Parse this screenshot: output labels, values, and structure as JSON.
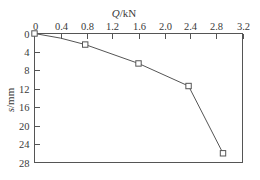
{
  "chart_data": {
    "type": "line",
    "title": "",
    "xlabel": "Q/kN",
    "ylabel": "s/mm",
    "xlabel_var": "Q",
    "xlabel_unit": "/kN",
    "ylabel_var": "s",
    "ylabel_unit": "/mm",
    "x_axis_position": "top",
    "y_axis_direction": "inverted",
    "grid": false,
    "legend": false,
    "legend_position": "none",
    "xlim": [
      0,
      3.2
    ],
    "ylim": [
      0,
      28
    ],
    "xticks": [
      0,
      0.4,
      0.8,
      1.2,
      1.6,
      2.0,
      2.4,
      2.8,
      3.2
    ],
    "xticklabels": [
      "0",
      "0.4",
      "0.8",
      "1.2",
      "1.6",
      "2.0",
      "2.4",
      "2.8",
      "3.2"
    ],
    "yticks": [
      0,
      4,
      8,
      12,
      16,
      20,
      24,
      28
    ],
    "yticklabels": [
      "0",
      "4",
      "8",
      "12",
      "16",
      "20",
      "24",
      "28"
    ],
    "marker": "square-open",
    "line_color": "#555555",
    "marker_face_color": "#ffffff",
    "marker_edge_color": "#555555",
    "x": [
      0,
      0.4,
      0.78,
      1.6,
      2.37,
      2.9
    ],
    "y": [
      0,
      1.0,
      2.4,
      6.5,
      11.4,
      26.0
    ],
    "marker_x": [
      0,
      0.78,
      1.6,
      2.37,
      2.9
    ],
    "marker_y": [
      0,
      2.4,
      6.5,
      11.4,
      26.0
    ],
    "points": [
      {
        "Q": 0,
        "s": 0.0,
        "marker": true
      },
      {
        "Q": 0.4,
        "s": 1.0,
        "marker": false
      },
      {
        "Q": 0.78,
        "s": 2.4,
        "marker": true
      },
      {
        "Q": 1.6,
        "s": 6.5,
        "marker": true
      },
      {
        "Q": 2.37,
        "s": 11.4,
        "marker": true
      },
      {
        "Q": 2.9,
        "s": 26.0,
        "marker": true
      }
    ]
  }
}
